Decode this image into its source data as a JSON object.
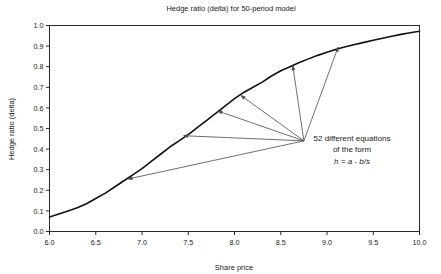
{
  "chart_data": {
    "type": "line",
    "title": "Hedge ratio (delta) for 50-period model",
    "xlabel": "Share price",
    "ylabel": "Hedge ratio (delta)",
    "xlim": [
      6.0,
      10.0
    ],
    "ylim": [
      0.0,
      1.0
    ],
    "grid": false,
    "legend": "none",
    "xticks": [
      "6.0",
      "6.5",
      "7.0",
      "7.5",
      "8.0",
      "8.5",
      "9.0",
      "9.5",
      "10.0"
    ],
    "yticks": [
      "0.0",
      "0.1",
      "0.2",
      "0.3",
      "0.4",
      "0.5",
      "0.6",
      "0.7",
      "0.8",
      "0.9",
      "1.0"
    ],
    "xtick_values": [
      6.0,
      6.5,
      7.0,
      7.5,
      8.0,
      8.5,
      9.0,
      9.5,
      10.0
    ],
    "ytick_values": [
      0.0,
      0.1,
      0.2,
      0.3,
      0.4,
      0.5,
      0.6,
      0.7,
      0.8,
      0.9,
      1.0
    ],
    "series": [
      {
        "name": "Hedge ratio (delta)",
        "color": "#111111",
        "x": [
          6.0,
          6.1,
          6.2,
          6.3,
          6.4,
          6.5,
          6.6,
          6.7,
          6.8,
          6.9,
          7.0,
          7.1,
          7.2,
          7.3,
          7.4,
          7.5,
          7.6,
          7.7,
          7.8,
          7.9,
          8.0,
          8.1,
          8.2,
          8.3,
          8.4,
          8.5,
          8.6,
          8.7,
          8.8,
          8.9,
          9.0,
          9.1,
          9.2,
          9.3,
          9.4,
          9.5,
          9.6,
          9.7,
          9.8,
          9.9,
          10.0
        ],
        "y": [
          0.07,
          0.085,
          0.1,
          0.115,
          0.135,
          0.16,
          0.185,
          0.215,
          0.245,
          0.275,
          0.305,
          0.34,
          0.375,
          0.41,
          0.44,
          0.47,
          0.505,
          0.54,
          0.575,
          0.61,
          0.645,
          0.675,
          0.7,
          0.725,
          0.755,
          0.78,
          0.8,
          0.82,
          0.838,
          0.855,
          0.87,
          0.885,
          0.897,
          0.908,
          0.918,
          0.928,
          0.938,
          0.948,
          0.957,
          0.965,
          0.972
        ]
      }
    ],
    "annotations": [
      {
        "name": "equations-note",
        "lines": [
          "52 different equations",
          "of the form"
        ],
        "formula": "h = a - b/s",
        "x": 8.75,
        "y": 0.44,
        "arrow_targets": [
          {
            "x": 6.85,
            "y": 0.255
          },
          {
            "x": 7.45,
            "y": 0.465
          },
          {
            "x": 7.82,
            "y": 0.585
          },
          {
            "x": 8.07,
            "y": 0.66
          },
          {
            "x": 8.63,
            "y": 0.805
          },
          {
            "x": 9.12,
            "y": 0.895
          }
        ]
      }
    ]
  }
}
